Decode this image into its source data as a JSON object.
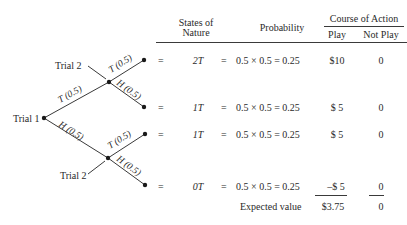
{
  "header": {
    "states_of_nature": [
      "States of",
      "Nature"
    ],
    "probability": "Probability",
    "course_of_action": "Course of Action",
    "play": "Play",
    "not_play": "Not Play"
  },
  "tree": {
    "root_label": "Trial 1",
    "trial2_label": "Trial 2",
    "branch_tail": "T (0.5)",
    "branch_head": "H (0.5)"
  },
  "rows": [
    {
      "eq": "=",
      "state": "2T",
      "eq2": "=",
      "probability": "0.5 × 0.5 = 0.25",
      "play": "$10",
      "not_play": "0"
    },
    {
      "eq": "=",
      "state": "1T",
      "eq2": "=",
      "probability": "0.5 × 0.5 = 0.25",
      "play": "$ 5",
      "not_play": "0"
    },
    {
      "eq": "=",
      "state": "1T",
      "eq2": "=",
      "probability": "0.5 × 0.5 = 0.25",
      "play": "$ 5",
      "not_play": "0"
    },
    {
      "eq": "=",
      "state": "0T",
      "eq2": "=",
      "probability": "0.5 × 0.5 = 0.25",
      "play": "–$ 5",
      "not_play": "0"
    }
  ],
  "footer": {
    "label": "Expected value",
    "play": "$3.75",
    "not_play": "0"
  }
}
